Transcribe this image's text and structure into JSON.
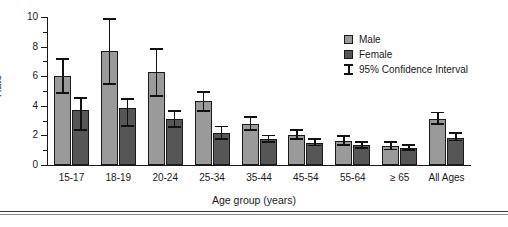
{
  "chart_data": {
    "type": "bar",
    "title": "",
    "xlabel": "Age group (years)",
    "ylabel": "Rate",
    "ylim": [
      0,
      10
    ],
    "ytick_labels": [
      "0",
      "2",
      "4",
      "6",
      "8",
      "10"
    ],
    "ytick_values": [
      0,
      2,
      4,
      6,
      8,
      10
    ],
    "yminor_values": [
      1,
      3,
      5,
      7,
      9
    ],
    "grid": false,
    "legend_position": "top-right",
    "categories": [
      "15-17",
      "18-19",
      "20-24",
      "25-34",
      "35-44",
      "45-54",
      "55-64",
      "≥ 65",
      "All Ages"
    ],
    "series": [
      {
        "name": "Male",
        "color": "#9a9a9a",
        "values": [
          6.0,
          7.7,
          6.3,
          4.3,
          2.8,
          2.0,
          1.6,
          1.3,
          3.1
        ],
        "ci_low": [
          4.8,
          5.4,
          4.6,
          3.6,
          2.3,
          1.7,
          1.3,
          1.0,
          2.7
        ],
        "ci_high": [
          7.2,
          9.9,
          7.9,
          5.0,
          3.3,
          2.4,
          2.0,
          1.6,
          3.6
        ]
      },
      {
        "name": "Female",
        "color": "#565656",
        "values": [
          3.7,
          3.85,
          3.1,
          2.15,
          1.75,
          1.5,
          1.35,
          1.15,
          1.85
        ],
        "ci_low": [
          2.3,
          2.6,
          2.5,
          1.7,
          1.5,
          1.25,
          1.1,
          0.95,
          1.6
        ],
        "ci_high": [
          4.6,
          4.5,
          3.7,
          2.65,
          2.05,
          1.8,
          1.6,
          1.4,
          2.2
        ]
      }
    ],
    "error_bar_label": "95% Confidence Interval"
  },
  "legend": {
    "items": [
      {
        "label": "Male",
        "swatch": "male-swatch"
      },
      {
        "label": "Female",
        "swatch": "female-swatch"
      },
      {
        "label": "95% Confidence Interval",
        "swatch": "ci-marker"
      }
    ]
  },
  "axes": {
    "y_title": "Rate",
    "x_title": "Age group (years)"
  }
}
